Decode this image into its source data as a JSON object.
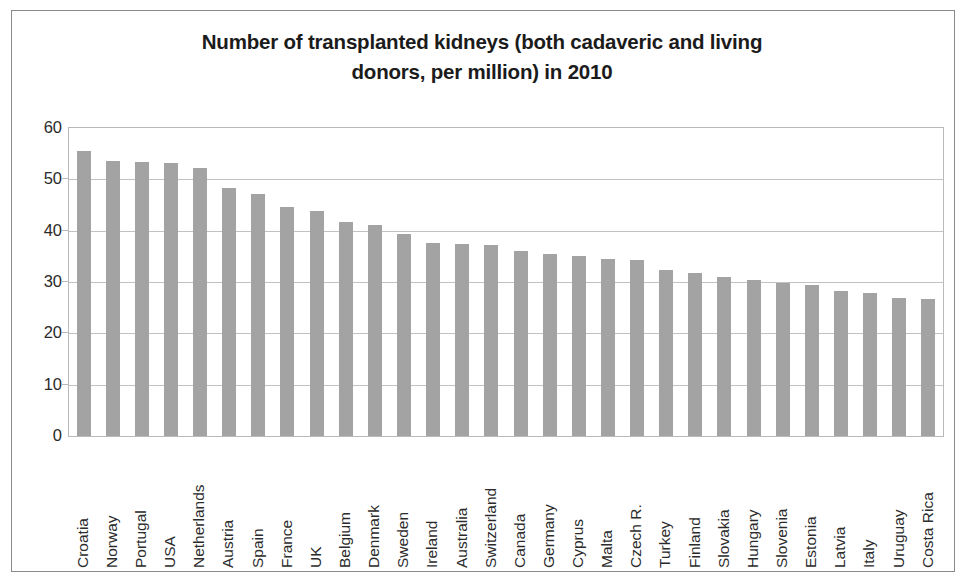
{
  "chart_data": {
    "type": "bar",
    "title": "Number of transplanted kidneys (both cadaveric and living donors, per million) in 2010",
    "title_line1": "Number of transplanted kidneys (both cadaveric and living",
    "title_line2": "donors, per million) in 2010",
    "xlabel": "",
    "ylabel": "",
    "ylim": [
      0,
      60
    ],
    "ytick_values": [
      0,
      10,
      20,
      30,
      40,
      50,
      60
    ],
    "ytick_labels": [
      "0",
      "10",
      "20",
      "30",
      "40",
      "50",
      "60"
    ],
    "grid": true,
    "grid_axis": "y",
    "legend": false,
    "bar_color": "#a3a3a3",
    "categories": [
      "Croatia",
      "Norway",
      "Portugal",
      "USA",
      "Netherlands",
      "Austria",
      "Spain",
      "France",
      "UK",
      "Belgium",
      "Denmark",
      "Sweden",
      "Ireland",
      "Australia",
      "Switzerland",
      "Canada",
      "Germany",
      "Cyprus",
      "Malta",
      "Czech R.",
      "Turkey",
      "Finland",
      "Slovakia",
      "Hungary",
      "Slovenia",
      "Estonia",
      "Latvia",
      "Italy",
      "Uruguay",
      "Costa Rica"
    ],
    "values": [
      55.6,
      53.5,
      53.3,
      53.1,
      52.2,
      48.3,
      47.2,
      44.6,
      43.8,
      41.6,
      41.2,
      39.3,
      37.6,
      37.4,
      37.3,
      36.0,
      35.5,
      35.0,
      34.5,
      34.3,
      32.3,
      31.7,
      30.9,
      30.3,
      29.9,
      29.4,
      28.3,
      27.9,
      26.8,
      26.7
    ]
  }
}
